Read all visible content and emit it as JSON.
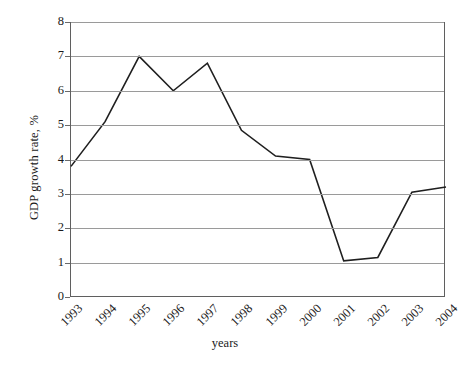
{
  "chart_data": {
    "type": "line",
    "title": "",
    "xlabel": "years",
    "ylabel": "GDP growth rate, %",
    "categories": [
      "1993",
      "1994",
      "1995",
      "1996",
      "1997",
      "1998",
      "1999",
      "2000",
      "2001",
      "2002",
      "2003",
      "2004"
    ],
    "values": [
      3.8,
      5.1,
      7.0,
      6.0,
      6.8,
      4.85,
      4.1,
      4.0,
      1.05,
      1.15,
      3.05,
      3.2
    ],
    "series": [
      {
        "name": "GDP growth rate",
        "values": [
          3.8,
          5.1,
          7.0,
          6.0,
          6.8,
          4.85,
          4.1,
          4.0,
          1.05,
          1.15,
          3.05,
          3.2
        ]
      }
    ],
    "ylim": [
      0,
      8
    ],
    "y_ticks": [
      0,
      1,
      2,
      3,
      4,
      5,
      6,
      7,
      8
    ],
    "y_tick_labels": [
      "0",
      "1",
      "2",
      "3",
      "4",
      "5",
      "6",
      "7",
      "8"
    ],
    "x_tick_labels": [
      "1993",
      "1994",
      "1995",
      "1996",
      "1997",
      "1998",
      "1999",
      "2000",
      "2001",
      "2002",
      "2003",
      "2004"
    ],
    "grid": true,
    "grid_axis": "y",
    "legend": false,
    "legend_position": "none",
    "line_color": "#1f1f1f",
    "grid_color": "#9a9a9a",
    "axis_color": "#5f5f5f",
    "background_color": "#ffffff",
    "x_tick_label_rotation": -45
  }
}
